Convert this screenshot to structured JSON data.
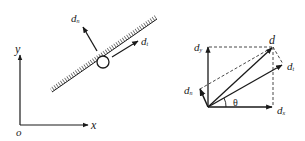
{
  "left_diagram": {
    "axes": {
      "y_label": "y",
      "x_label": "x",
      "origin_label": "o"
    },
    "vectors": [
      {
        "name": "d",
        "sub": "n",
        "desc": "normal displacement"
      },
      {
        "name": "d",
        "sub": "t",
        "desc": "tangential displacement"
      }
    ]
  },
  "right_diagram": {
    "vectors": [
      {
        "name": "d",
        "sub": ""
      },
      {
        "name": "d",
        "sub": "x"
      },
      {
        "name": "d",
        "sub": "y"
      },
      {
        "name": "d",
        "sub": "t"
      },
      {
        "name": "d",
        "sub": "n"
      }
    ],
    "angle_label": "θ"
  },
  "colors": {
    "ink": "#1a1a1a",
    "background": "#ffffff"
  }
}
